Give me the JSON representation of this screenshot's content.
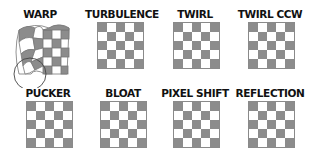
{
  "colors": {
    "dark_square": "#8c8c8c",
    "light_square": "#ffffff",
    "label": "#111111",
    "outline": "#555555"
  },
  "filters": [
    {
      "label": "WARP",
      "icon": "warped-checkerboard-icon",
      "note": "distorted grid with circle brush outline"
    },
    {
      "label": "TURBULENCE",
      "icon": "checkerboard-icon"
    },
    {
      "label": "TWIRL",
      "icon": "checkerboard-icon"
    },
    {
      "label": "TWIRL CCW",
      "icon": "checkerboard-icon"
    },
    {
      "label": "PUCKER",
      "icon": "checkerboard-icon"
    },
    {
      "label": "BLOAT",
      "icon": "checkerboard-icon"
    },
    {
      "label": "PIXEL SHIFT",
      "icon": "checkerboard-icon"
    },
    {
      "label": "REFLECTION",
      "icon": "checkerboard-icon"
    }
  ]
}
